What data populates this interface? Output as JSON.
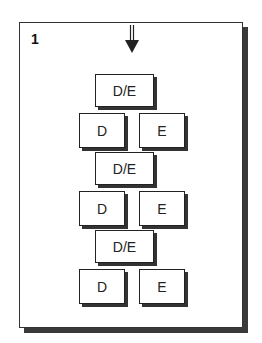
{
  "panel": {
    "number": "1"
  },
  "arrow": {
    "icon": "down-arrow-icon"
  },
  "rows": [
    {
      "merged": "D/E",
      "left": "D",
      "right": "E"
    },
    {
      "merged": "D/E",
      "left": "D",
      "right": "E"
    },
    {
      "merged": "D/E",
      "left": "D",
      "right": "E"
    }
  ],
  "colors": {
    "border": "#222222",
    "shadow": "#333333",
    "background": "#ffffff"
  }
}
